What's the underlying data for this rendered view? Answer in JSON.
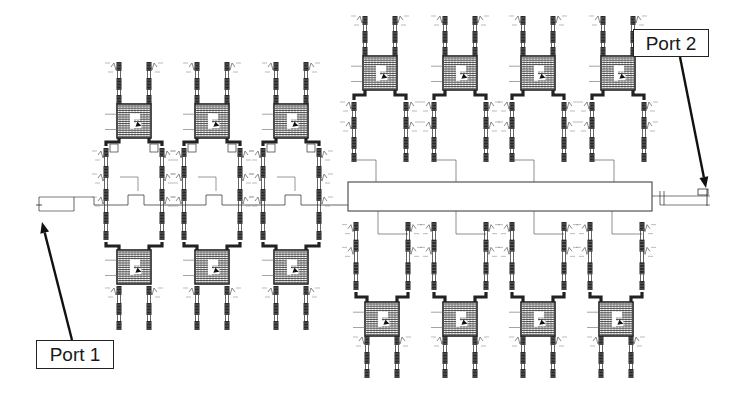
{
  "figure": {
    "type": "circuit-layout",
    "colors": {
      "trace": "#222222",
      "dense": "#333333",
      "background": "#ffffff",
      "label_border": "#222222"
    }
  },
  "labels": {
    "port1": {
      "text": "Port 1",
      "box": [
        36,
        340,
        78,
        29
      ],
      "arrow_from": [
        72,
        340
      ],
      "arrow_to": [
        42,
        222
      ]
    },
    "port2": {
      "text": "Port 2",
      "box": [
        633,
        29,
        76,
        28
      ],
      "arrow_from": [
        680,
        57
      ],
      "arrow_to": [
        706,
        188
      ]
    }
  },
  "feed": {
    "y": 205,
    "input_stub": {
      "x1": 36,
      "x2": 98
    },
    "output_stub": {
      "x1": 652,
      "x2": 710
    }
  },
  "left_units": [
    {
      "cx": 134,
      "top": 62,
      "bottom": 330
    },
    {
      "cx": 212,
      "top": 62,
      "bottom": 330
    },
    {
      "cx": 291,
      "top": 62,
      "bottom": 330
    }
  ],
  "manifold": {
    "x": 348,
    "y": 182,
    "w": 304,
    "h": 29
  },
  "top_units": [
    {
      "cx": 380,
      "top": 16,
      "bottom": 172
    },
    {
      "cx": 460,
      "top": 16,
      "bottom": 172
    },
    {
      "cx": 538,
      "top": 16,
      "bottom": 172
    },
    {
      "cx": 618,
      "top": 16,
      "bottom": 172
    }
  ],
  "bottom_units": [
    {
      "cx": 382,
      "top": 222,
      "bottom": 378
    },
    {
      "cx": 460,
      "top": 222,
      "bottom": 378
    },
    {
      "cx": 538,
      "top": 222,
      "bottom": 378
    },
    {
      "cx": 616,
      "top": 222,
      "bottom": 378
    }
  ]
}
